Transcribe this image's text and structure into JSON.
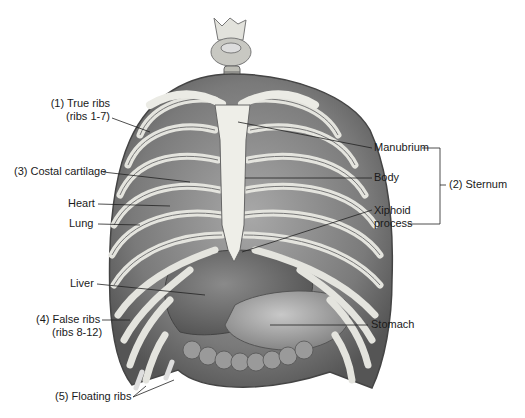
{
  "diagram": {
    "labels": {
      "true_ribs": "(1) True ribs",
      "true_ribs_sub": "(ribs 1-7)",
      "costal_cartilage": "(3) Costal cartilage",
      "heart": "Heart",
      "lung": "Lung",
      "liver": "Liver",
      "false_ribs": "(4) False ribs",
      "false_ribs_sub": "(ribs 8-12)",
      "floating_ribs": "(5) Floating ribs",
      "manubrium": "Manubrium",
      "body": "Body",
      "xiphoid": "Xiphoid",
      "xiphoid_sub": "process",
      "sternum": "(2) Sternum",
      "stomach": "Stomach"
    },
    "colors": {
      "background": "#ffffff",
      "text": "#1a1a1a",
      "leader_line": "#222222",
      "bone": "#e6e6e0",
      "tissue_dark": "#6e6e6e",
      "tissue_mid": "#9a9a9a"
    }
  }
}
